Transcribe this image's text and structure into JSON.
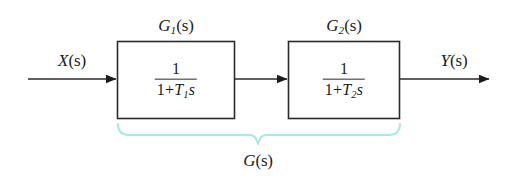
{
  "diagram": {
    "background_color": "#ffffff",
    "line_color": "#2a2a2a",
    "brace_color": "#aee8e4",
    "signals": {
      "input": {
        "label_main": "X",
        "label_arg": "(s)"
      },
      "output": {
        "label_main": "Y",
        "label_arg": "(s)"
      }
    },
    "blocks": [
      {
        "name": "block-g1",
        "label_main": "G",
        "label_sub": "1",
        "label_arg": "(s)",
        "numerator": "1",
        "denominator_lead": "1+",
        "denominator_var": "T",
        "denominator_sub": "1",
        "denominator_tail": "s"
      },
      {
        "name": "block-g2",
        "label_main": "G",
        "label_sub": "2",
        "label_arg": "(s)",
        "numerator": "1",
        "denominator_lead": "1+",
        "denominator_var": "T",
        "denominator_sub": "2",
        "denominator_tail": "s"
      }
    ],
    "group": {
      "label_main": "G",
      "label_arg": "(s)"
    }
  }
}
